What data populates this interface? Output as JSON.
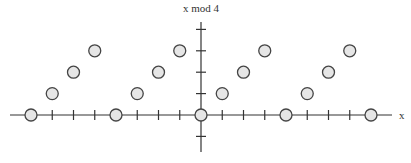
{
  "chart_data": {
    "type": "scatter",
    "title": "",
    "xlabel": "x",
    "ylabel": "x mod 4",
    "xlim": [
      -8,
      8
    ],
    "ylim": [
      -1,
      4
    ],
    "grid": false,
    "legend": null,
    "x_ticks": [
      -8,
      -7,
      -6,
      -5,
      -4,
      -3,
      -2,
      -1,
      0,
      1,
      2,
      3,
      4,
      5,
      6,
      7,
      8
    ],
    "y_ticks": [
      -1,
      1,
      2,
      3,
      4
    ],
    "tick_labels_shown": false,
    "series": [
      {
        "name": "x mod 4",
        "x": [
          -8,
          -7,
          -6,
          -5,
          -4,
          -3,
          -2,
          -1,
          0,
          1,
          2,
          3,
          4,
          5,
          6,
          7,
          8
        ],
        "y": [
          0,
          1,
          2,
          3,
          0,
          1,
          2,
          3,
          0,
          1,
          2,
          3,
          0,
          1,
          2,
          3,
          0
        ]
      }
    ],
    "marker": {
      "shape": "circle",
      "fill": "#e6e6e6",
      "stroke": "#444444"
    },
    "axis_color": "#333333"
  }
}
